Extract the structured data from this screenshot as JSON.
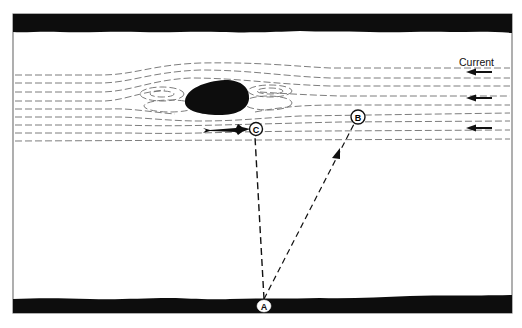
{
  "diagram": {
    "type": "river-crossing-flow-diagram",
    "labels": {
      "current": "Current",
      "point_a": "A",
      "point_b": "B",
      "point_c": "C"
    },
    "colors": {
      "ink": "#111111",
      "background": "#ffffff",
      "frame": "#7a7a7a",
      "flow_lines": "#6e6e6e"
    },
    "elements": {
      "top_bank": "riverbank-top",
      "bottom_bank": "riverbank-bottom",
      "rock": "boulder-obstacle",
      "fish": "fish-icon",
      "current_arrows": 3
    },
    "paths": [
      {
        "from": "A",
        "to": "C",
        "style": "dashed",
        "arrowhead": false
      },
      {
        "from": "A",
        "to": "B",
        "style": "dashed",
        "arrowhead": true
      }
    ]
  }
}
